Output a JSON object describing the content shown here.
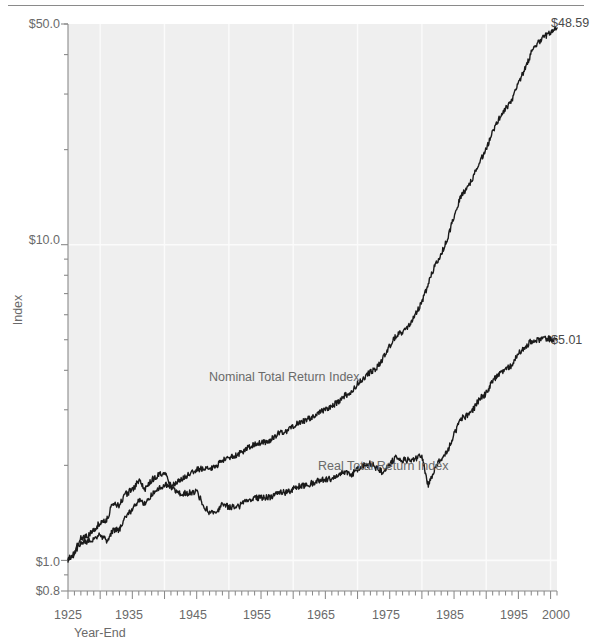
{
  "chart_data": {
    "type": "line",
    "title": "",
    "xlabel": "Year-End",
    "ylabel": "Index",
    "scale": "log",
    "grid": true,
    "legend_position": "inline-annotations",
    "xlim": [
      1925,
      2001
    ],
    "ylim": [
      0.8,
      50.0
    ],
    "x_ticks": [
      {
        "value": 1925,
        "label": "1925"
      },
      {
        "value": 1935,
        "label": "1935"
      },
      {
        "value": 1945,
        "label": "1945"
      },
      {
        "value": 1955,
        "label": "1955"
      },
      {
        "value": 1965,
        "label": "1965"
      },
      {
        "value": 1975,
        "label": "1975"
      },
      {
        "value": 1985,
        "label": "1985"
      },
      {
        "value": 1995,
        "label": "1995"
      },
      {
        "value": 2000,
        "label": "2000"
      }
    ],
    "y_ticks": [
      {
        "value": 0.8,
        "label": "$0.8"
      },
      {
        "value": 1.0,
        "label": "$1.0"
      },
      {
        "value": 10.0,
        "label": "$10.0"
      },
      {
        "value": 50.0,
        "label": "$50.0"
      }
    ],
    "end_labels": [
      {
        "series": "Nominal Total Return Index",
        "label": "$48.59",
        "value": 48.59
      },
      {
        "series": "Real Total Return Index",
        "label": "$5.01",
        "value": 5.01
      }
    ],
    "annotations": [
      {
        "text": "Nominal Total Return Index",
        "x": 1958,
        "y": 3.05
      },
      {
        "text": "Real Total Return Index",
        "x": 1976,
        "y": 2.0
      }
    ],
    "series": [
      {
        "name": "Nominal Total Return Index",
        "x": [
          1925,
          1926,
          1927,
          1928,
          1929,
          1930,
          1931,
          1932,
          1933,
          1934,
          1935,
          1936,
          1937,
          1938,
          1939,
          1940,
          1941,
          1942,
          1943,
          1944,
          1945,
          1946,
          1947,
          1948,
          1949,
          1950,
          1951,
          1952,
          1953,
          1954,
          1955,
          1956,
          1957,
          1958,
          1959,
          1960,
          1961,
          1962,
          1963,
          1964,
          1965,
          1966,
          1967,
          1968,
          1969,
          1970,
          1971,
          1972,
          1973,
          1974,
          1975,
          1976,
          1977,
          1978,
          1979,
          1980,
          1981,
          1982,
          1983,
          1984,
          1985,
          1986,
          1987,
          1988,
          1989,
          1990,
          1991,
          1992,
          1993,
          1994,
          1995,
          1996,
          1997,
          1998,
          1999,
          2000,
          2001
        ],
        "values": [
          1.0,
          1.05,
          1.14,
          1.15,
          1.17,
          1.21,
          1.15,
          1.25,
          1.25,
          1.38,
          1.45,
          1.55,
          1.52,
          1.61,
          1.68,
          1.74,
          1.72,
          1.78,
          1.83,
          1.88,
          1.94,
          1.96,
          1.94,
          1.99,
          2.07,
          2.11,
          2.15,
          2.2,
          2.28,
          2.33,
          2.35,
          2.38,
          2.45,
          2.55,
          2.57,
          2.66,
          2.74,
          2.78,
          2.86,
          2.93,
          3.0,
          3.08,
          3.18,
          3.32,
          3.4,
          3.63,
          3.8,
          3.95,
          4.08,
          4.38,
          4.78,
          5.14,
          5.31,
          5.56,
          6.0,
          6.6,
          7.5,
          8.6,
          9.35,
          10.5,
          12.3,
          14.2,
          15.1,
          16.4,
          18.4,
          20.1,
          22.8,
          25.1,
          27.0,
          28.6,
          32.5,
          36.0,
          40.5,
          43.5,
          45.5,
          47.0,
          48.59
        ],
        "color": "#1a1a1a"
      },
      {
        "name": "Real Total Return Index",
        "x": [
          1925,
          1926,
          1927,
          1928,
          1929,
          1930,
          1931,
          1932,
          1933,
          1934,
          1935,
          1936,
          1937,
          1938,
          1939,
          1940,
          1941,
          1942,
          1943,
          1944,
          1945,
          1946,
          1947,
          1948,
          1949,
          1950,
          1951,
          1952,
          1953,
          1954,
          1955,
          1956,
          1957,
          1958,
          1959,
          1960,
          1961,
          1962,
          1963,
          1964,
          1965,
          1966,
          1967,
          1968,
          1969,
          1970,
          1971,
          1972,
          1973,
          1974,
          1975,
          1976,
          1977,
          1978,
          1979,
          1980,
          1981,
          1982,
          1983,
          1984,
          1985,
          1986,
          1987,
          1988,
          1989,
          1990,
          1991,
          1992,
          1993,
          1994,
          1995,
          1996,
          1997,
          1998,
          1999,
          2000,
          2001
        ],
        "values": [
          1.0,
          1.07,
          1.18,
          1.2,
          1.24,
          1.32,
          1.35,
          1.52,
          1.5,
          1.62,
          1.68,
          1.78,
          1.68,
          1.8,
          1.86,
          1.9,
          1.72,
          1.62,
          1.63,
          1.64,
          1.66,
          1.5,
          1.42,
          1.43,
          1.5,
          1.48,
          1.47,
          1.5,
          1.55,
          1.58,
          1.58,
          1.58,
          1.6,
          1.65,
          1.64,
          1.68,
          1.72,
          1.72,
          1.76,
          1.79,
          1.8,
          1.82,
          1.86,
          1.9,
          1.86,
          1.95,
          2.0,
          2.03,
          1.96,
          1.9,
          2.02,
          2.12,
          2.08,
          2.08,
          2.1,
          2.15,
          1.72,
          1.95,
          2.1,
          2.22,
          2.5,
          2.8,
          2.88,
          3.02,
          3.25,
          3.38,
          3.7,
          3.92,
          4.05,
          4.15,
          4.52,
          4.7,
          4.95,
          5.0,
          5.05,
          5.02,
          5.01
        ],
        "color": "#1a1a1a"
      }
    ]
  },
  "figure": {
    "axis_x_title": "Year-End",
    "axis_y_title": "Index",
    "y_label_top": "$50.0",
    "y_label_mid": "$10.0",
    "y_label_low": "$1.0",
    "y_label_bottom": "$0.8",
    "x_label_1925": "1925",
    "x_label_1935": "1935",
    "x_label_1945": "1945",
    "x_label_1955": "1955",
    "x_label_1965": "1965",
    "x_label_1975": "1975",
    "x_label_1985": "1985",
    "x_label_1995": "1995",
    "x_label_2000": "2000",
    "end_label_nominal": "$48.59",
    "end_label_real": "$5.01",
    "series_label_nominal": "Nominal Total Return Index",
    "series_label_real": "Real Total Return Index"
  },
  "colors": {
    "plot_background": "#efefef",
    "gridline": "#fbfbfb",
    "axis": "#8a8a8a",
    "line": "#1a1a1a",
    "text": "#6a6a6a"
  }
}
